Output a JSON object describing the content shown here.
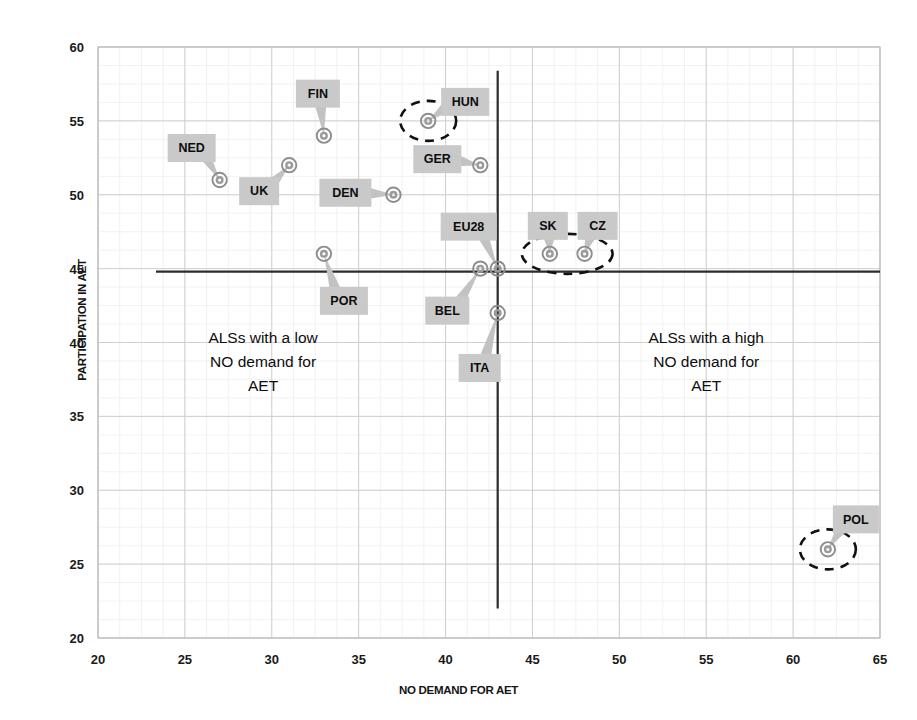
{
  "chart_data": {
    "type": "scatter",
    "title": "",
    "xlabel": "NO DEMAND FOR AET",
    "ylabel": "PARTICIPATION IN AET",
    "xlim": [
      20,
      65
    ],
    "ylim": [
      20,
      60
    ],
    "xticks": [
      20,
      25,
      30,
      35,
      40,
      45,
      50,
      55,
      60,
      65
    ],
    "yticks": [
      20,
      25,
      30,
      35,
      40,
      45,
      50,
      55,
      60
    ],
    "grid": true,
    "legend": "none",
    "points": [
      {
        "label": "NED",
        "x": 27,
        "y": 51,
        "highlighted": false
      },
      {
        "label": "UK",
        "x": 31,
        "y": 52,
        "highlighted": false
      },
      {
        "label": "FIN",
        "x": 33,
        "y": 54,
        "highlighted": false
      },
      {
        "label": "POR",
        "x": 33,
        "y": 46,
        "highlighted": false
      },
      {
        "label": "DEN",
        "x": 37,
        "y": 50,
        "highlighted": false
      },
      {
        "label": "HUN",
        "x": 39,
        "y": 55,
        "highlighted": true
      },
      {
        "label": "GER",
        "x": 42,
        "y": 52,
        "highlighted": false
      },
      {
        "label": "BEL",
        "x": 42,
        "y": 45,
        "highlighted": false
      },
      {
        "label": "EU28",
        "x": 43,
        "y": 45,
        "highlighted": false
      },
      {
        "label": "ITA",
        "x": 43,
        "y": 42,
        "highlighted": false
      },
      {
        "label": "SK",
        "x": 46,
        "y": 46,
        "highlighted": true
      },
      {
        "label": "CZ",
        "x": 48,
        "y": 46,
        "highlighted": true
      },
      {
        "label": "POL",
        "x": 62,
        "y": 26,
        "highlighted": true
      }
    ],
    "reference_lines": [
      {
        "orientation": "horizontal",
        "value": 44.8
      },
      {
        "orientation": "vertical",
        "value": 43.0
      }
    ],
    "annotations": [
      {
        "name": "low-demand-quadrant",
        "lines": [
          "ALSs with a low",
          "NO demand for",
          "AET"
        ],
        "x": 29.5,
        "y": 40.0
      },
      {
        "name": "high-demand-quadrant",
        "lines": [
          "ALSs with a high",
          "NO demand for",
          "AET"
        ],
        "x": 55.0,
        "y": 40.0
      }
    ],
    "highlight_groups": [
      {
        "name": "hun-highlight",
        "points": [
          "HUN"
        ]
      },
      {
        "name": "sk-cz-highlight",
        "points": [
          "SK",
          "CZ"
        ]
      },
      {
        "name": "pol-highlight",
        "points": [
          "POL"
        ]
      }
    ],
    "colors": {
      "marker_stroke": "#8d8d8d",
      "callout_bg": "#c9c9c9",
      "reference_line": "#2b2b2b",
      "grid_major": "#cfcfcf",
      "grid_minor": "#ececec",
      "highlight_stroke": "#111111",
      "text": "#0d0d0d"
    }
  },
  "label_offsets": {
    "NED": {
      "dx": -28,
      "dy": -32,
      "w": 48,
      "h": 28
    },
    "UK": {
      "dx": -30,
      "dy": 26,
      "w": 40,
      "h": 28
    },
    "FIN": {
      "dx": -6,
      "dy": -42,
      "w": 44,
      "h": 28
    },
    "POR": {
      "dx": 20,
      "dy": 47,
      "w": 48,
      "h": 28
    },
    "DEN": {
      "dx": -48,
      "dy": -2,
      "w": 52,
      "h": 28
    },
    "HUN": {
      "dx": 37,
      "dy": -19,
      "w": 48,
      "h": 28
    },
    "GER": {
      "dx": -43,
      "dy": -6,
      "w": 48,
      "h": 28
    },
    "BEL": {
      "dx": -33,
      "dy": 42,
      "w": 44,
      "h": 28
    },
    "EU28": {
      "dx": -29,
      "dy": -42,
      "w": 56,
      "h": 28
    },
    "ITA": {
      "dx": -18,
      "dy": 55,
      "w": 42,
      "h": 28
    },
    "SK": {
      "dx": -2,
      "dy": -28,
      "w": 40,
      "h": 28
    },
    "CZ": {
      "dx": 13,
      "dy": -28,
      "w": 40,
      "h": 28
    },
    "POL": {
      "dx": 28,
      "dy": -30,
      "w": 46,
      "h": 28
    }
  }
}
